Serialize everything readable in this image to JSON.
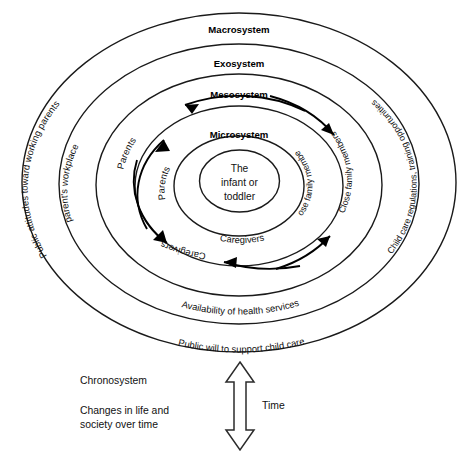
{
  "diagram": {
    "rings": {
      "macrosystem_label": "Macrosystem",
      "exosystem_label": "Exosystem",
      "mesosystem_label": "Mesosystem",
      "microsystem_label": "Microsystem"
    },
    "core": {
      "line1": "The",
      "line2": "infant or",
      "line3": "toddler"
    },
    "microsystem_members": {
      "left": "Parents",
      "right": "Close family members",
      "bottom": "Caregivers"
    },
    "mesosystem_members": {
      "left": "Parents",
      "right": "Close family members",
      "bottom": "Caregivers"
    },
    "exosystem_items": {
      "left": "parent's workplace",
      "right": "Child care regulations, training opportunities",
      "bottom": "Availability of health services"
    },
    "macrosystem_items": {
      "left": "Public attitudes toward working parents",
      "bottom": "Public will to support child care"
    },
    "chronosystem": {
      "label": "Chronosystem",
      "description_line1": "Changes in life and",
      "description_line2": "society over time",
      "time_label": "Time"
    },
    "colors": {
      "stroke": "#1a1a1a",
      "text": "#111111",
      "background": "#ffffff"
    }
  }
}
